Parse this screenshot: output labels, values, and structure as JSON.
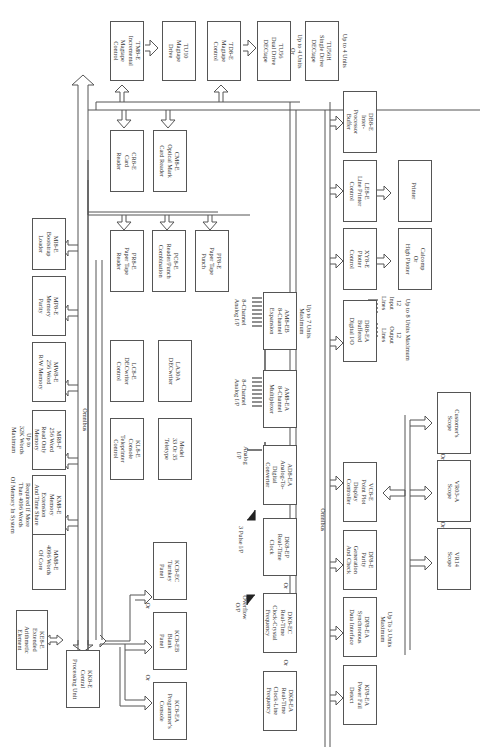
{
  "diagram": {
    "orientation": "rotated 90 degrees clockwise",
    "bus_label": "Omnibus",
    "boxes": [
      {
        "id": "kc8e-cpu",
        "label": "KK8-E\nCentral\nProcessing Unit"
      },
      {
        "id": "ke8e",
        "label": "KE8-E\nExtended\nArithmetic\nElement"
      },
      {
        "id": "mm8e",
        "label": "MM8-E\n4096 Words\nOf Core"
      },
      {
        "id": "km8e",
        "label": "KM8-E\nMemory\nExtension\nAnd Time Share"
      },
      {
        "id": "mr8f",
        "label": "MR8-F\n256 Word\nRead Only\nMemory"
      },
      {
        "id": "mw8e",
        "label": "MW8-E\n256 Word\nR/W Memory"
      },
      {
        "id": "mp8e",
        "label": "MP8-E\nMemory\nParity"
      },
      {
        "id": "mi8e",
        "label": "MI8-E\nBootstrap\nLoader"
      },
      {
        "id": "kc8ea",
        "label": "KC8-EA\nProgrammer's\nConsole"
      },
      {
        "id": "kc8eb",
        "label": "KC8-EB\nBlank\nPanel"
      },
      {
        "id": "kc8ec",
        "label": "KC8-EC\nTurnkey\nPanel"
      },
      {
        "id": "kl8e",
        "label": "KL8-E\nConsole\nTeleprinter\nControl"
      },
      {
        "id": "teletype",
        "label": "Model\n33 Or 35\nTeletype"
      },
      {
        "id": "lc8e",
        "label": "LC8-E\nDECwriter\nControl"
      },
      {
        "id": "la30a",
        "label": "LA30A\nDECwriter"
      },
      {
        "id": "pr8e",
        "label": "PR8-E\nPaper Tape\nReader"
      },
      {
        "id": "pc8e",
        "label": "PC8-E\nReader/Punch\nCombination"
      },
      {
        "id": "pp8e",
        "label": "PP8-E\nPaper Tape\nPunch"
      },
      {
        "id": "cr8e",
        "label": "CR8-E\nCard\nReader"
      },
      {
        "id": "cm8e",
        "label": "CM8-E\nOptical Mark\nCard Reader"
      },
      {
        "id": "tm8e",
        "label": "TM8-E\nIncremental\nMagtape\nControl"
      },
      {
        "id": "tu10",
        "label": "TU10\nMagtape\nDrive"
      },
      {
        "id": "td8e",
        "label": "TD8-E\nMagtape\nControl"
      },
      {
        "id": "tu56",
        "label": "TU56\nDual Drive\nDECtape"
      },
      {
        "id": "tu56h",
        "label": "TU56H\nSingle Drive\nDECtape"
      },
      {
        "id": "db8e",
        "label": "DB8-E\nInter-\nProcessor\nBuffer"
      },
      {
        "id": "ls8e",
        "label": "LE8-E\nLine Printer\nControl"
      },
      {
        "id": "printer",
        "label": "Printer"
      },
      {
        "id": "xy8e",
        "label": "XY8-E\nPlotter\nControl"
      },
      {
        "id": "calcomp",
        "label": "Calcomp\nOr\nHigh Plotter"
      },
      {
        "id": "dr8ea-dio",
        "label": "DR8-EA\nBuffered\nDigital I/O"
      },
      {
        "id": "am8eb",
        "label": "AM8-EB\n8-Channel\nExpansion"
      },
      {
        "id": "am8ea",
        "label": "AM8-EA\n8-Channel\nMultiplexer"
      },
      {
        "id": "ad8ea",
        "label": "AD8-EA\nAnalog-To-\nDigital\nConverter"
      },
      {
        "id": "dk8ep",
        "label": "DK8-EP\nReal-Time\nClock"
      },
      {
        "id": "dk8ec",
        "label": "DK8-EC\nReal-Time\nClock-Crystal\nFrequency"
      },
      {
        "id": "dk8ea",
        "label": "DK8-EA\nReal-Time\nClock-Line\nFrequency"
      },
      {
        "id": "kp8ea",
        "label": "KP8-EA\nPower Fail\nDetect"
      },
      {
        "id": "dp8ea",
        "label": "DP8-EA\nSynchronous\nData Interface"
      },
      {
        "id": "mp8e-parity",
        "label": "DP8-E\nParity\nGeneration\nAnd Check"
      },
      {
        "id": "vc8e",
        "label": "VC8-E\nPoint Plot\nDisplay\nController"
      },
      {
        "id": "vr14",
        "label": "VR14\nScope"
      },
      {
        "id": "vr03a",
        "label": "VR03-A\nScope"
      },
      {
        "id": "custscope",
        "label": "Customer's\nScope"
      }
    ],
    "notes": {
      "memory_required": "Required If More\nThan 4096 Words\nOf Memory In System",
      "memory_max": "Up to\n32K Words\nMaximum",
      "tu56_max": "Up to 4 Units\nOr",
      "tu56h_max": "Up to 4 Units",
      "am8eb_max": "Up to 7 Units\nMaximum",
      "dr8_output": "12\nOutput\nLines",
      "dr8_input": "12\nInput\nLines",
      "dr8_max": "Up to 8 Units Maximum",
      "dp8_max": "Up To 3 Units\nMaximum",
      "analog_in": "Analog\nI/P",
      "pulse_in": "3 Pulse I/P",
      "overflow_out": "Overflow\nO/P",
      "am8ea_in": "8-Channel\nAnalog I/P",
      "am8eb_in": "8-Channel\nAnalog I/P",
      "or": "Or"
    }
  }
}
